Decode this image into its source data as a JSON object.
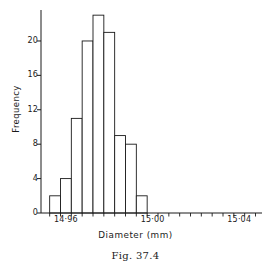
{
  "figure": {
    "caption": "Fig. 37.4"
  },
  "chart_data": {
    "type": "bar",
    "title": "",
    "xlabel": "Diameter (mm)",
    "ylabel": "Frequency",
    "grid": false,
    "legend": null,
    "bin_width": 0.005,
    "bin_edges": [
      14.9525,
      14.9575,
      14.9625,
      14.9675,
      14.9725,
      14.9775,
      14.9825,
      14.9875,
      14.9925,
      14.9975
    ],
    "categories": [
      "14.955",
      "14.960",
      "14.965",
      "14.970",
      "14.975",
      "14.980",
      "14.985",
      "14.990",
      "14.995"
    ],
    "values": [
      2,
      4,
      11,
      20,
      23,
      21,
      9,
      8,
      2
    ],
    "xlim": [
      14.9485,
      15.0505
    ],
    "ylim": [
      0,
      23.6
    ],
    "yticks": [
      0,
      4,
      8,
      12,
      16,
      20
    ],
    "ytick_labels": [
      "0",
      "4",
      "8",
      "12",
      "16",
      "20"
    ],
    "xtick_labels": [
      "14·96",
      "15·00",
      "15·04"
    ],
    "xtick_values": [
      14.96,
      15.0,
      15.04
    ],
    "xminor_count": 21,
    "series": [
      {
        "name": "Frequency",
        "values": [
          2,
          4,
          11,
          20,
          23,
          21,
          9,
          8,
          2
        ]
      }
    ]
  },
  "style": {
    "axis_color": "#1a1a1a",
    "bar_stroke": "#1a1a1a",
    "bar_fill": "#ffffff",
    "background": "#ffffff"
  }
}
